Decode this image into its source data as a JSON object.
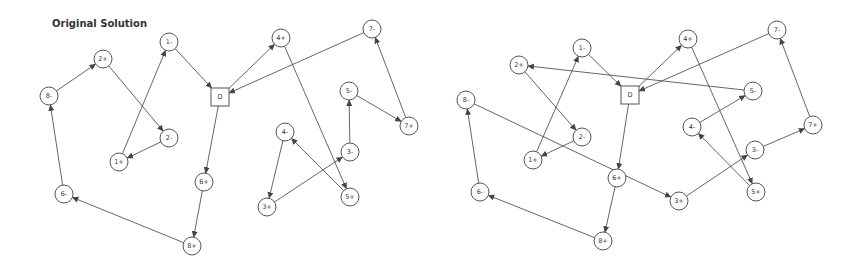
{
  "diagrams": [
    {
      "id": "left",
      "title": "Original Solution",
      "title_pos": [
        52,
        27
      ],
      "depot": {
        "label": "D",
        "x": 220,
        "y": 97,
        "size": 18
      },
      "nodes": [
        {
          "label": "1-",
          "x": 169,
          "y": 42
        },
        {
          "label": "2+",
          "x": 103,
          "y": 59
        },
        {
          "label": "8-",
          "x": 49,
          "y": 96
        },
        {
          "label": "2-",
          "x": 169,
          "y": 138
        },
        {
          "label": "1+",
          "x": 119,
          "y": 162
        },
        {
          "label": "6-",
          "x": 64,
          "y": 194
        },
        {
          "label": "6+",
          "x": 204,
          "y": 182
        },
        {
          "label": "8+",
          "x": 192,
          "y": 246
        },
        {
          "label": "4+",
          "x": 281,
          "y": 38
        },
        {
          "label": "7-",
          "x": 372,
          "y": 29
        },
        {
          "label": "5-",
          "x": 349,
          "y": 91
        },
        {
          "label": "7+",
          "x": 409,
          "y": 126
        },
        {
          "label": "4-",
          "x": 285,
          "y": 132
        },
        {
          "label": "3-",
          "x": 350,
          "y": 152
        },
        {
          "label": "5+",
          "x": 350,
          "y": 197
        },
        {
          "label": "3+",
          "x": 267,
          "y": 207
        }
      ],
      "routes": [
        [
          "D",
          "4+",
          "5+",
          "4-",
          "3+",
          "3-",
          "5-",
          "7+",
          "7-",
          "D"
        ],
        [
          "D",
          "6+",
          "8+",
          "6-",
          "8-",
          "2+",
          "2-",
          "1+",
          "1-",
          "D"
        ]
      ]
    },
    {
      "id": "right",
      "title": "",
      "title_pos": [
        0,
        0
      ],
      "depot": {
        "label": "D",
        "x": 630,
        "y": 95,
        "size": 18
      },
      "nodes": [
        {
          "label": "1-",
          "x": 582,
          "y": 48
        },
        {
          "label": "2+",
          "x": 519,
          "y": 65
        },
        {
          "label": "8-",
          "x": 466,
          "y": 100
        },
        {
          "label": "2-",
          "x": 582,
          "y": 137
        },
        {
          "label": "1+",
          "x": 533,
          "y": 160
        },
        {
          "label": "6-",
          "x": 480,
          "y": 192
        },
        {
          "label": "6+",
          "x": 617,
          "y": 178
        },
        {
          "label": "8+",
          "x": 603,
          "y": 241
        },
        {
          "label": "4+",
          "x": 688,
          "y": 39
        },
        {
          "label": "7-",
          "x": 777,
          "y": 30
        },
        {
          "label": "5-",
          "x": 753,
          "y": 91
        },
        {
          "label": "4-",
          "x": 692,
          "y": 127
        },
        {
          "label": "7+",
          "x": 813,
          "y": 125
        },
        {
          "label": "3-",
          "x": 755,
          "y": 150
        },
        {
          "label": "5+",
          "x": 756,
          "y": 192
        },
        {
          "label": "3+",
          "x": 679,
          "y": 201
        }
      ],
      "routes": [
        [
          "D",
          "4+",
          "5+",
          "4-",
          "5-",
          "2+",
          "2-",
          "1+",
          "1-",
          "D"
        ],
        [
          "D",
          "6+",
          "8+",
          "6-",
          "8-",
          "3+",
          "3-",
          "7+",
          "7-",
          "D"
        ]
      ]
    }
  ],
  "style": {
    "node_radius": 9,
    "edge_color": "#555555",
    "text_color": "#333333",
    "background": "#ffffff"
  }
}
